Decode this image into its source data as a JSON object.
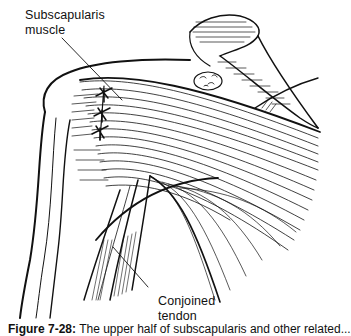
{
  "figure": {
    "labels": {
      "subscapularis": [
        "Subscapularis",
        "muscle"
      ],
      "conjoined": [
        "Conjoined",
        "tendon"
      ]
    },
    "caption": {
      "number": "Figure 7-28:",
      "text": "The upper half of subscapularis and other related..."
    },
    "colors": {
      "ink": "#111111",
      "background": "#ffffff"
    }
  }
}
